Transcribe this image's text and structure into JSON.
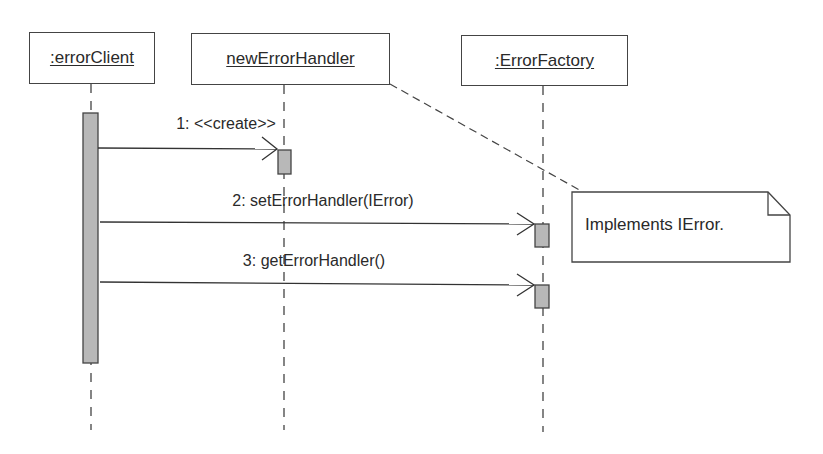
{
  "diagram": {
    "type": "UML sequence diagram",
    "objects": [
      {
        "id": "errorClient",
        "label": ":errorClient"
      },
      {
        "id": "newErrorHandler",
        "label": "newErrorHandler"
      },
      {
        "id": "ErrorFactory",
        "label": ":ErrorFactory"
      }
    ],
    "messages": [
      {
        "label": "1: <<create>>",
        "from": "errorClient",
        "to": "newErrorHandler"
      },
      {
        "label": "2: setErrorHandler(IError)",
        "from": "errorClient",
        "to": "ErrorFactory"
      },
      {
        "label": "3: getErrorHandler()",
        "from": "errorClient",
        "to": "ErrorFactory"
      }
    ],
    "note": {
      "text": "Implements IError.",
      "attached_to": "newErrorHandler"
    },
    "colors": {
      "line": "#444444",
      "activation_fill": "#b8b8b8",
      "background": "#ffffff"
    }
  }
}
